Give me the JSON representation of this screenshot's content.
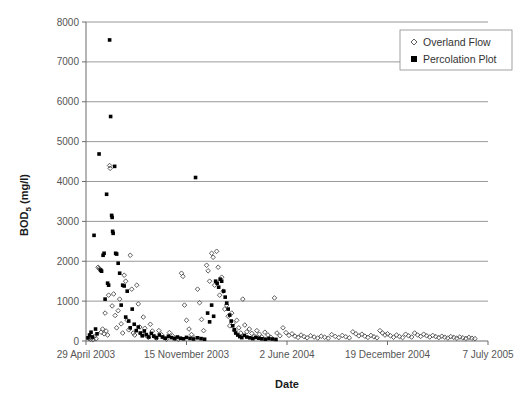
{
  "chart_data": {
    "type": "scatter",
    "title": "",
    "xlabel": "Date",
    "ylabel": "BOD5 (mg/l)",
    "ylabel_base": "BOD",
    "ylabel_sub": "5",
    "ylabel_unit": " (mg/l)",
    "grid": "horizontal",
    "legend_position": "top-right",
    "ylim": [
      0,
      8000
    ],
    "yticks": [
      0,
      1000,
      2000,
      3000,
      4000,
      5000,
      6000,
      7000,
      8000
    ],
    "ytick_labels": [
      "0",
      "1000",
      "2000",
      "3000",
      "4000",
      "5000",
      "6000",
      "7000",
      "8000"
    ],
    "xtick_labels": [
      "29 April 2003",
      "15 November 2003",
      "2 June 2004",
      "19 December 2004",
      "7 July 2005"
    ],
    "xlim_days": [
      0,
      800
    ],
    "xtick_days": [
      0,
      200,
      400,
      600,
      800
    ],
    "series": [
      {
        "name": "Overland Flow",
        "marker": "open-diamond",
        "color": "#4d4d4d",
        "points": [
          [
            6,
            60
          ],
          [
            9,
            40
          ],
          [
            12,
            90
          ],
          [
            14,
            30
          ],
          [
            17,
            120
          ],
          [
            20,
            55
          ],
          [
            24,
            1850
          ],
          [
            26,
            1820
          ],
          [
            28,
            1800
          ],
          [
            30,
            220
          ],
          [
            33,
            300
          ],
          [
            36,
            180
          ],
          [
            38,
            700
          ],
          [
            40,
            250
          ],
          [
            43,
            150
          ],
          [
            45,
            1150
          ],
          [
            47,
            4400
          ],
          [
            48,
            4330
          ],
          [
            52,
            880
          ],
          [
            55,
            1180
          ],
          [
            58,
            640
          ],
          [
            61,
            330
          ],
          [
            64,
            760
          ],
          [
            67,
            1050
          ],
          [
            70,
            430
          ],
          [
            73,
            200
          ],
          [
            76,
            1650
          ],
          [
            79,
            1500
          ],
          [
            82,
            520
          ],
          [
            85,
            280
          ],
          [
            88,
            2150
          ],
          [
            91,
            1300
          ],
          [
            94,
            200
          ],
          [
            97,
            150
          ],
          [
            101,
            1400
          ],
          [
            104,
            930
          ],
          [
            107,
            350
          ],
          [
            110,
            180
          ],
          [
            114,
            600
          ],
          [
            117,
            320
          ],
          [
            120,
            140
          ],
          [
            124,
            90
          ],
          [
            128,
            420
          ],
          [
            132,
            250
          ],
          [
            136,
            120
          ],
          [
            140,
            70
          ],
          [
            145,
            260
          ],
          [
            150,
            160
          ],
          [
            155,
            80
          ],
          [
            160,
            45
          ],
          [
            166,
            210
          ],
          [
            172,
            130
          ],
          [
            178,
            60
          ],
          [
            184,
            40
          ],
          [
            190,
            1700
          ],
          [
            193,
            1620
          ],
          [
            196,
            900
          ],
          [
            200,
            520
          ],
          [
            205,
            300
          ],
          [
            210,
            160
          ],
          [
            215,
            80
          ],
          [
            222,
            1300
          ],
          [
            226,
            960
          ],
          [
            230,
            540
          ],
          [
            234,
            260
          ],
          [
            240,
            1900
          ],
          [
            243,
            1760
          ],
          [
            246,
            1500
          ],
          [
            250,
            2200
          ],
          [
            253,
            2100
          ],
          [
            256,
            1400
          ],
          [
            260,
            2250
          ],
          [
            263,
            1850
          ],
          [
            266,
            1150
          ],
          [
            270,
            1600
          ],
          [
            273,
            1250
          ],
          [
            276,
            800
          ],
          [
            280,
            900
          ],
          [
            283,
            620
          ],
          [
            286,
            380
          ],
          [
            290,
            700
          ],
          [
            293,
            450
          ],
          [
            296,
            260
          ],
          [
            300,
            520
          ],
          [
            304,
            330
          ],
          [
            308,
            200
          ],
          [
            312,
            1050
          ],
          [
            316,
            400
          ],
          [
            320,
            230
          ],
          [
            325,
            300
          ],
          [
            330,
            190
          ],
          [
            335,
            120
          ],
          [
            340,
            260
          ],
          [
            345,
            170
          ],
          [
            350,
            100
          ],
          [
            356,
            220
          ],
          [
            362,
            150
          ],
          [
            368,
            90
          ],
          [
            375,
            1080
          ],
          [
            380,
            200
          ],
          [
            386,
            130
          ],
          [
            392,
            330
          ],
          [
            398,
            210
          ],
          [
            404,
            140
          ],
          [
            410,
            180
          ],
          [
            416,
            120
          ],
          [
            422,
            90
          ],
          [
            428,
            150
          ],
          [
            434,
            110
          ],
          [
            440,
            80
          ],
          [
            447,
            130
          ],
          [
            454,
            100
          ],
          [
            461,
            75
          ],
          [
            468,
            120
          ],
          [
            475,
            95
          ],
          [
            482,
            70
          ],
          [
            489,
            160
          ],
          [
            496,
            115
          ],
          [
            503,
            85
          ],
          [
            510,
            140
          ],
          [
            517,
            105
          ],
          [
            524,
            80
          ],
          [
            531,
            230
          ],
          [
            537,
            180
          ],
          [
            543,
            130
          ],
          [
            549,
            170
          ],
          [
            555,
            120
          ],
          [
            561,
            90
          ],
          [
            567,
            140
          ],
          [
            573,
            105
          ],
          [
            579,
            80
          ],
          [
            585,
            260
          ],
          [
            590,
            200
          ],
          [
            595,
            150
          ],
          [
            600,
            180
          ],
          [
            606,
            130
          ],
          [
            612,
            95
          ],
          [
            618,
            150
          ],
          [
            624,
            110
          ],
          [
            630,
            85
          ],
          [
            636,
            170
          ],
          [
            642,
            130
          ],
          [
            648,
            100
          ],
          [
            654,
            200
          ],
          [
            660,
            150
          ],
          [
            666,
            115
          ],
          [
            672,
            170
          ],
          [
            678,
            130
          ],
          [
            684,
            100
          ],
          [
            690,
            140
          ],
          [
            696,
            110
          ],
          [
            702,
            85
          ],
          [
            708,
            120
          ],
          [
            714,
            95
          ],
          [
            720,
            75
          ],
          [
            726,
            110
          ],
          [
            732,
            90
          ],
          [
            738,
            70
          ],
          [
            744,
            100
          ],
          [
            750,
            80
          ],
          [
            756,
            65
          ],
          [
            762,
            90
          ],
          [
            768,
            70
          ],
          [
            774,
            60
          ]
        ]
      },
      {
        "name": "Percolation Plot",
        "marker": "filled-square",
        "color": "#000000",
        "points": [
          [
            4,
            80
          ],
          [
            7,
            150
          ],
          [
            10,
            220
          ],
          [
            13,
            100
          ],
          [
            16,
            2650
          ],
          [
            19,
            300
          ],
          [
            22,
            180
          ],
          [
            26,
            4690
          ],
          [
            29,
            1780
          ],
          [
            31,
            1750
          ],
          [
            34,
            2150
          ],
          [
            36,
            2200
          ],
          [
            38,
            1050
          ],
          [
            41,
            3680
          ],
          [
            43,
            1450
          ],
          [
            45,
            1400
          ],
          [
            47,
            7550
          ],
          [
            49,
            5630
          ],
          [
            51,
            3150
          ],
          [
            52,
            3100
          ],
          [
            53,
            2750
          ],
          [
            54,
            2700
          ],
          [
            57,
            4380
          ],
          [
            59,
            2200
          ],
          [
            61,
            2180
          ],
          [
            64,
            1950
          ],
          [
            67,
            1700
          ],
          [
            70,
            900
          ],
          [
            73,
            1400
          ],
          [
            76,
            1380
          ],
          [
            79,
            600
          ],
          [
            82,
            1250
          ],
          [
            85,
            500
          ],
          [
            88,
            330
          ],
          [
            92,
            800
          ],
          [
            96,
            420
          ],
          [
            100,
            260
          ],
          [
            104,
            350
          ],
          [
            108,
            200
          ],
          [
            112,
            130
          ],
          [
            116,
            250
          ],
          [
            120,
            160
          ],
          [
            125,
            100
          ],
          [
            130,
            190
          ],
          [
            135,
            120
          ],
          [
            140,
            80
          ],
          [
            146,
            150
          ],
          [
            152,
            100
          ],
          [
            158,
            70
          ],
          [
            164,
            120
          ],
          [
            170,
            85
          ],
          [
            176,
            60
          ],
          [
            182,
            100
          ],
          [
            188,
            70
          ],
          [
            194,
            55
          ],
          [
            200,
            90
          ],
          [
            207,
            65
          ],
          [
            214,
            50
          ],
          [
            218,
            4100
          ],
          [
            222,
            80
          ],
          [
            229,
            60
          ],
          [
            236,
            45
          ],
          [
            242,
            700
          ],
          [
            246,
            480
          ],
          [
            250,
            900
          ],
          [
            254,
            620
          ],
          [
            258,
            1500
          ],
          [
            261,
            1450
          ],
          [
            264,
            1350
          ],
          [
            267,
            1550
          ],
          [
            270,
            1500
          ],
          [
            274,
            1250
          ],
          [
            277,
            1100
          ],
          [
            280,
            950
          ],
          [
            283,
            800
          ],
          [
            286,
            650
          ],
          [
            289,
            500
          ],
          [
            292,
            380
          ],
          [
            295,
            280
          ],
          [
            298,
            200
          ],
          [
            302,
            150
          ],
          [
            306,
            110
          ],
          [
            310,
            85
          ],
          [
            315,
            140
          ],
          [
            320,
            100
          ],
          [
            326,
            80
          ],
          [
            332,
            60
          ],
          [
            338,
            90
          ],
          [
            344,
            70
          ],
          [
            350,
            55
          ],
          [
            357,
            45
          ],
          [
            364,
            60
          ],
          [
            371,
            50
          ],
          [
            378,
            40
          ]
        ]
      }
    ]
  }
}
